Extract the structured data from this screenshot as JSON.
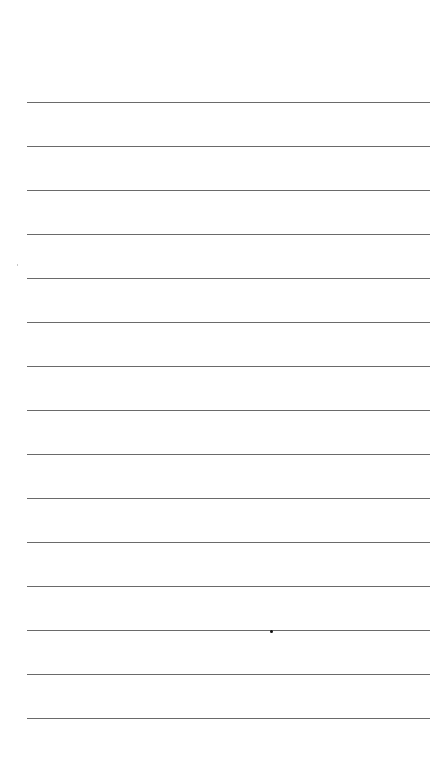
{
  "page": {
    "type": "lined-paper",
    "background": "#ffffff",
    "rule_color": "#6a6a6a",
    "rule_count": 15,
    "rules_y": [
      102,
      146,
      190,
      234,
      278,
      322,
      366,
      410,
      454,
      498,
      542,
      586,
      630,
      674,
      718
    ]
  },
  "marks": [
    {
      "type": "dot",
      "x": 270,
      "y": 630
    },
    {
      "type": "speck",
      "x": 17,
      "y": 264
    }
  ]
}
